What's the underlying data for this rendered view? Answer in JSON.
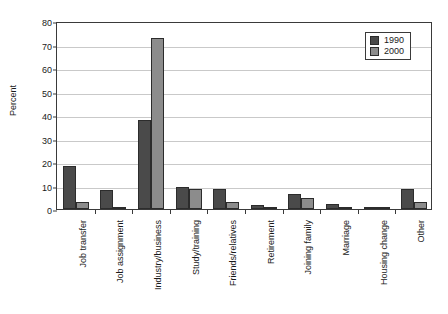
{
  "chart_data": {
    "type": "bar",
    "title": "",
    "xlabel": "",
    "ylabel": "Percent",
    "ylim": [
      0,
      80
    ],
    "yticks": [
      0,
      10,
      20,
      30,
      40,
      50,
      60,
      70,
      80
    ],
    "grid": true,
    "legend_position": "top-right",
    "categories": [
      "Job transfer",
      "Job assignment",
      "Industry/business",
      "Study/training",
      "Friends/relatives",
      "Retirement",
      "Joining family",
      "Marriage",
      "Housing change",
      "Other"
    ],
    "series": [
      {
        "name": "1990",
        "color": "#4a4a4a",
        "values": [
          18.5,
          8.0,
          38.0,
          9.5,
          8.5,
          1.5,
          6.5,
          2.0,
          0.5,
          8.5
        ]
      },
      {
        "name": "2000",
        "color": "#8c8c8c",
        "values": [
          3.0,
          1.0,
          72.7,
          8.5,
          3.0,
          0.4,
          4.5,
          0.6,
          0.3,
          3.0
        ]
      }
    ]
  },
  "legend": {
    "items": [
      {
        "label": "1990"
      },
      {
        "label": "2000"
      }
    ]
  }
}
